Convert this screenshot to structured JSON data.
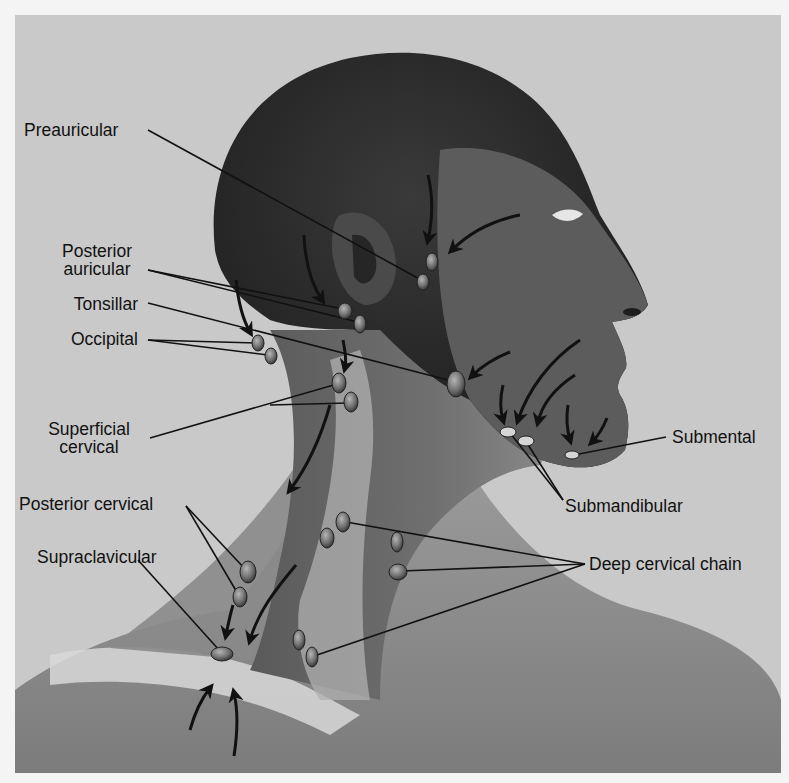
{
  "figure": {
    "background_color": "#c9c9c9",
    "frame_color": "#f4f4f4",
    "node_color": "#7a7a7a",
    "line_color": "#111111"
  },
  "labels": {
    "preauricular": "Preauricular",
    "posterior_auricular_1": "Posterior",
    "posterior_auricular_2": "auricular",
    "tonsillar": "Tonsillar",
    "occipital": "Occipital",
    "superficial_cervical_1": "Superficial",
    "superficial_cervical_2": "cervical",
    "posterior_cervical": "Posterior cervical",
    "supraclavicular": "Supraclavicular",
    "submental": "Submental",
    "submandibular": "Submandibular",
    "deep_cervical_chain": "Deep cervical chain"
  },
  "nodes": [
    {
      "group": "preauricular",
      "x": 432,
      "y": 262
    },
    {
      "group": "preauricular",
      "x": 423,
      "y": 282
    },
    {
      "group": "posterior_auricular",
      "x": 345,
      "y": 311
    },
    {
      "group": "posterior_auricular",
      "x": 360,
      "y": 324
    },
    {
      "group": "occipital",
      "x": 258,
      "y": 343
    },
    {
      "group": "occipital",
      "x": 271,
      "y": 356
    },
    {
      "group": "tonsillar",
      "x": 456,
      "y": 384
    },
    {
      "group": "superficial_cervical",
      "x": 339,
      "y": 383
    },
    {
      "group": "superficial_cervical",
      "x": 351,
      "y": 402
    },
    {
      "group": "submandibular",
      "x": 508,
      "y": 432
    },
    {
      "group": "submandibular",
      "x": 526,
      "y": 441
    },
    {
      "group": "submental",
      "x": 572,
      "y": 455
    },
    {
      "group": "deep_cervical",
      "x": 343,
      "y": 522
    },
    {
      "group": "deep_cervical",
      "x": 327,
      "y": 538
    },
    {
      "group": "deep_cervical",
      "x": 397,
      "y": 542
    },
    {
      "group": "deep_cervical",
      "x": 398,
      "y": 572
    },
    {
      "group": "deep_cervical",
      "x": 299,
      "y": 640
    },
    {
      "group": "deep_cervical",
      "x": 312,
      "y": 657
    },
    {
      "group": "posterior_cervical",
      "x": 248,
      "y": 572
    },
    {
      "group": "posterior_cervical",
      "x": 240,
      "y": 597
    },
    {
      "group": "supraclavicular",
      "x": 222,
      "y": 654
    }
  ]
}
